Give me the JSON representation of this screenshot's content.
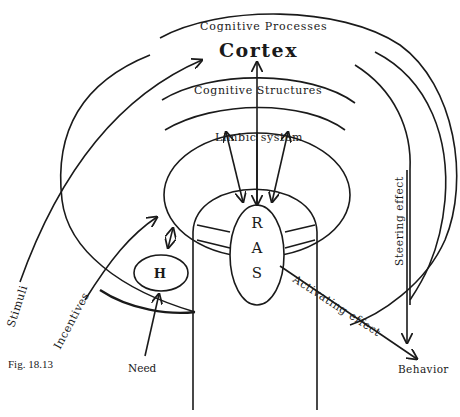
{
  "figure": {
    "caption": "Fig. 18.13",
    "stroke_color": "#1a1a1a",
    "background": "#ffffff"
  },
  "labels": {
    "cognitive_processes": "Cognitive Processes",
    "cortex": "Cortex",
    "cognitive_structures": "Cognitive Structures",
    "limbic_system": "Limbic system",
    "ras_r": "R",
    "ras_a": "A",
    "ras_s": "S",
    "hypothalamus": "H",
    "stimuli": "Stimuli",
    "incentives": "Incentives",
    "need": "Need",
    "activating_effect": "Activating effect",
    "steering_effect": "Steering effect",
    "behavior": "Behavior"
  }
}
